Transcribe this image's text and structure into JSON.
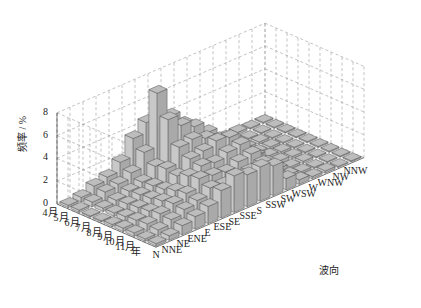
{
  "chart_data": {
    "type": "bar3d",
    "title": "",
    "ylabel": "频率 / %",
    "xlabel": "波向",
    "zlim": [
      0,
      8
    ],
    "z_ticks": [
      "0",
      "2",
      "4",
      "6",
      "8"
    ],
    "grid": true,
    "months": [
      "4月",
      "5月",
      "6月",
      "7月",
      "8月",
      "9月",
      "10月",
      "11月",
      "年"
    ],
    "directions": [
      "N",
      "NNE",
      "NE",
      "ENE",
      "E",
      "ESE",
      "SE",
      "SSE",
      "S",
      "SSW",
      "SW",
      "WSW",
      "W",
      "WNW",
      "NW",
      "NNW"
    ],
    "series": [
      {
        "name": "4月",
        "values": [
          0.2,
          0.4,
          0.9,
          1.2,
          2.0,
          3.6,
          4.5,
          3.2,
          2.6,
          1.6,
          0.3,
          0.2,
          0.2,
          0.2,
          0.1,
          0.1
        ]
      },
      {
        "name": "5月",
        "values": [
          0.2,
          0.4,
          0.8,
          1.0,
          1.5,
          2.8,
          7.5,
          5.0,
          3.8,
          2.4,
          0.6,
          0.2,
          0.2,
          0.1,
          0.1,
          0.1
        ]
      },
      {
        "name": "6月",
        "values": [
          0.1,
          0.3,
          0.5,
          0.8,
          1.1,
          2.0,
          5.6,
          4.6,
          4.0,
          3.0,
          1.0,
          0.3,
          0.2,
          0.2,
          0.1,
          0.1
        ]
      },
      {
        "name": "7月",
        "values": [
          0.1,
          0.3,
          0.6,
          0.9,
          1.2,
          2.2,
          3.6,
          3.8,
          3.4,
          2.8,
          1.5,
          0.5,
          0.2,
          0.2,
          0.1,
          0.1
        ]
      },
      {
        "name": "8月",
        "values": [
          0.2,
          0.4,
          0.7,
          1.0,
          1.3,
          2.0,
          3.0,
          3.2,
          3.6,
          3.4,
          1.8,
          0.8,
          0.3,
          0.2,
          0.1,
          0.1
        ]
      },
      {
        "name": "9月",
        "values": [
          0.3,
          0.5,
          0.8,
          1.2,
          1.6,
          2.4,
          2.8,
          2.6,
          3.0,
          3.2,
          1.6,
          0.6,
          0.3,
          0.2,
          0.1,
          0.1
        ]
      },
      {
        "name": "10月",
        "values": [
          0.3,
          0.6,
          1.0,
          1.4,
          1.8,
          2.6,
          2.4,
          2.2,
          2.6,
          2.8,
          1.2,
          0.5,
          0.2,
          0.2,
          0.1,
          0.1
        ]
      },
      {
        "name": "11月",
        "values": [
          0.2,
          0.5,
          0.9,
          1.3,
          1.6,
          2.2,
          2.0,
          1.8,
          2.2,
          2.4,
          1.0,
          0.4,
          0.2,
          0.1,
          0.1,
          0.1
        ]
      },
      {
        "name": "年",
        "values": [
          0.2,
          0.4,
          0.8,
          1.1,
          1.5,
          2.4,
          3.2,
          2.8,
          3.0,
          2.6,
          1.0,
          0.4,
          0.2,
          0.2,
          0.1,
          0.1
        ]
      }
    ],
    "colors": {
      "bar_top": "#bdbdbd",
      "bar_front": "#c8c8c8",
      "bar_side": "#a9a9a9",
      "edge": "#555555",
      "grid": "#9a9a9a"
    }
  }
}
